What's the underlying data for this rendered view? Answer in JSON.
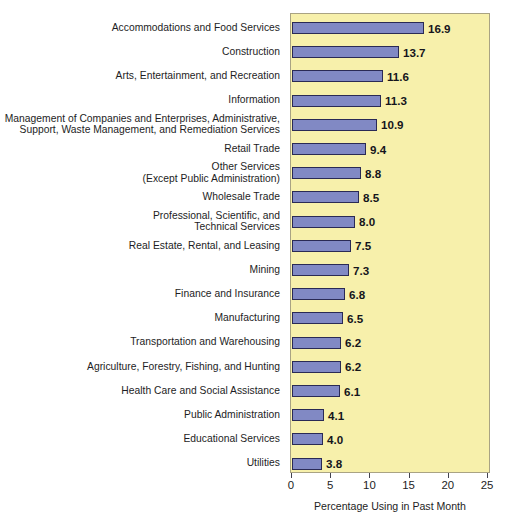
{
  "chart_data": {
    "type": "bar",
    "orientation": "horizontal",
    "title": "",
    "xlabel": "Percentage Using in Past Month",
    "ylabel": "",
    "xlim": [
      0,
      25
    ],
    "xticks": [
      0,
      5,
      10,
      15,
      20,
      25
    ],
    "xtick_labels": [
      "0",
      "5",
      "10",
      "15",
      "20",
      "25"
    ],
    "grid": false,
    "legend": null,
    "bar_color": "#8189c4",
    "bar_border_color": "#2a2a55",
    "plot_background_color": "#f7f0ab",
    "page_background_color": "#ffffff",
    "text_color": "#1d1d24",
    "categories": [
      "Accommodations and Food Services",
      "Construction",
      "Arts, Entertainment, and Recreation",
      "Information",
      "Management of Companies and Enterprises, Administrative,\nSupport, Waste Management, and Remediation Services",
      "Retail Trade",
      "Other Services\n(Except Public Administration)",
      "Wholesale Trade",
      "Professional, Scientific, and\nTechnical Services",
      "Real Estate, Rental, and Leasing",
      "Mining",
      "Finance and Insurance",
      "Manufacturing",
      "Transportation and Warehousing",
      "Agriculture, Forestry, Fishing, and Hunting",
      "Health Care and Social Assistance",
      "Public Administration",
      "Educational Services",
      "Utilities"
    ],
    "values": [
      16.9,
      13.7,
      11.6,
      11.3,
      10.9,
      9.4,
      8.8,
      8.5,
      8.0,
      7.5,
      7.3,
      6.8,
      6.5,
      6.2,
      6.2,
      6.1,
      4.1,
      4.0,
      3.8
    ],
    "value_labels": [
      "16.9",
      "13.7",
      "11.6",
      "11.3",
      "10.9",
      "9.4",
      "8.8",
      "8.5",
      "8.0",
      "7.5",
      "7.3",
      "6.8",
      "6.5",
      "6.2",
      "6.2",
      "6.1",
      "4.1",
      "4.0",
      "3.8"
    ]
  }
}
